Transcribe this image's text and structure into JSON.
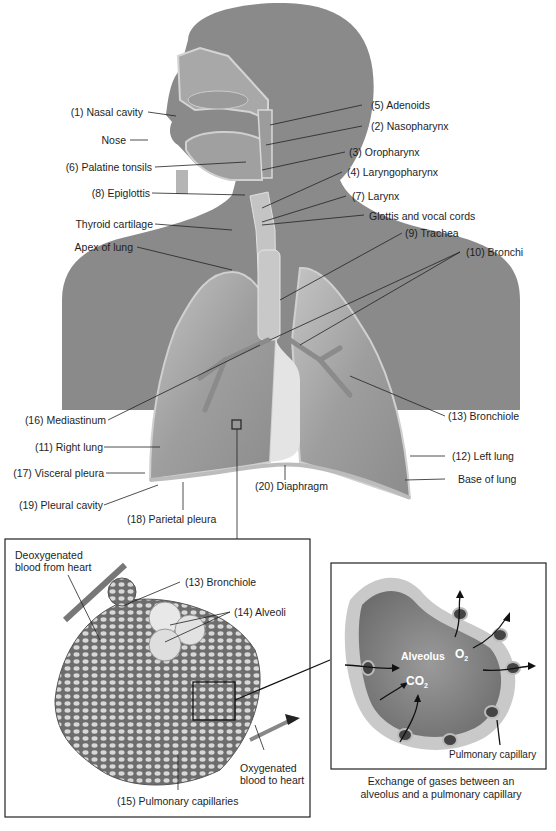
{
  "figure": {
    "labels_left": [
      {
        "id": "nasal-cavity",
        "text": "(1) Nasal cavity"
      },
      {
        "id": "nose",
        "text": "Nose"
      },
      {
        "id": "palatine-tonsils",
        "text": "(6) Palatine tonsils"
      },
      {
        "id": "epiglottis",
        "text": "(8) Epiglottis"
      },
      {
        "id": "thyroid-cartilage",
        "text": "Thyroid cartilage"
      },
      {
        "id": "apex-of-lung",
        "text": "Apex of lung"
      },
      {
        "id": "mediastinum",
        "text": "(16) Mediastinum"
      },
      {
        "id": "right-lung",
        "text": "(11) Right lung"
      },
      {
        "id": "visceral-pleura",
        "text": "(17) Visceral pleura"
      },
      {
        "id": "pleural-cavity",
        "text": "(19) Pleural cavity"
      },
      {
        "id": "parietal-pleura",
        "text": "(18) Parietal pleura"
      }
    ],
    "labels_right": [
      {
        "id": "adenoids",
        "text": "(5) Adenoids"
      },
      {
        "id": "nasopharynx",
        "text": "(2) Nasopharynx"
      },
      {
        "id": "oropharynx",
        "text": "(3) Oropharynx"
      },
      {
        "id": "laryngopharynx",
        "text": "(4) Laryngopharynx"
      },
      {
        "id": "larynx",
        "text": "(7) Larynx"
      },
      {
        "id": "glottis",
        "text": "Glottis and vocal cords"
      },
      {
        "id": "trachea",
        "text": "(9) Trachea"
      },
      {
        "id": "bronchi",
        "text": "(10) Bronchi"
      },
      {
        "id": "bronchiole",
        "text": "(13) Bronchiole"
      },
      {
        "id": "left-lung",
        "text": "(12) Left lung"
      },
      {
        "id": "base-of-lung",
        "text": "Base of lung"
      }
    ],
    "label_center": {
      "diaphragm": "(20) Diaphragm"
    },
    "inset_alveoli": {
      "deoxygenated_line1": "Deoxygenated",
      "deoxygenated_line2": "blood from heart",
      "bronchiole": "(13) Bronchiole",
      "alveoli": "(14) Alveoli",
      "oxygenated_line1": "Oxygenated",
      "oxygenated_line2": "blood to heart",
      "capillaries": "(15) Pulmonary capillaries"
    },
    "inset_exchange": {
      "alveolus": "Alveolus",
      "o2": "O",
      "o2_sub": "2",
      "co2": "CO",
      "co2_sub": "2",
      "capillary": "Pulmonary capillary",
      "caption_line1": "Exchange of gases between an",
      "caption_line2": "alveolus and a pulmonary capillary"
    },
    "colors": {
      "silhouette": "#8a8a8a",
      "lung": "#a9a9a9",
      "lung_edge": "#cfcfcf",
      "heart_space": "#e6e6e6",
      "line": "#1a1a1a"
    }
  }
}
